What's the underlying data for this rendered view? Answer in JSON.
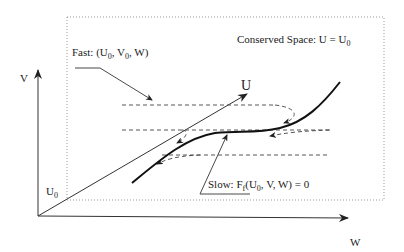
{
  "diagram": {
    "axes": {
      "v_label": "V",
      "w_label": "W",
      "u_label": "U",
      "u0_label": "U",
      "u0_sub": "0"
    },
    "box_label": {
      "text": "Conserved Space: U = U",
      "sub": "0"
    },
    "fast_label": {
      "prefix": "Fast: (U",
      "sub1": "0",
      "mid": ", V",
      "sub2": "0",
      "suffix": ", W)"
    },
    "slow_label": {
      "prefix": "Slow: F",
      "sub_f": "f",
      "mid": "(U",
      "sub0": "0",
      "suffix": ", V, W) = 0"
    },
    "colors": {
      "line": "#222222",
      "dotted_box": "#999999",
      "dashed": "#444444"
    }
  }
}
